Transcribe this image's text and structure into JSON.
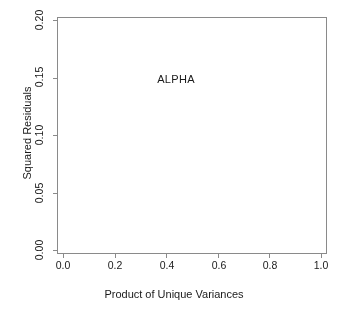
{
  "chart_data": {
    "type": "scatter",
    "title": "",
    "xlabel": "Product of Unique Variances",
    "ylabel": "Squared Residuals",
    "xlim": [
      0.0,
      1.0
    ],
    "ylim": [
      0.0,
      0.2
    ],
    "xticks": [
      "0.0",
      "0.2",
      "0.4",
      "0.6",
      "0.8",
      "1.0"
    ],
    "xtick_values": [
      0.0,
      0.2,
      0.4,
      0.6,
      0.8,
      1.0
    ],
    "yticks": [
      "0.00",
      "0.05",
      "0.10",
      "0.15",
      "0.20"
    ],
    "ytick_values": [
      0.0,
      0.05,
      0.1,
      0.15,
      0.2
    ],
    "grid": false,
    "legend": "none",
    "marker": "open-circle",
    "marker_color": "#000000",
    "marker_size_px": 3.1,
    "annotations": [
      {
        "text": "ALPHA",
        "x": 0.44,
        "y": 0.147
      }
    ],
    "point_count_approx": 3000,
    "outliers": [
      {
        "x": 0.131,
        "y": 0.108
      },
      {
        "x": 0.128,
        "y": 0.085
      },
      {
        "x": 0.126,
        "y": 0.076
      },
      {
        "x": 0.04,
        "y": 0.067
      },
      {
        "x": 0.085,
        "y": 0.057
      },
      {
        "x": 0.228,
        "y": 0.055
      },
      {
        "x": 0.402,
        "y": 0.06
      },
      {
        "x": 0.423,
        "y": 0.06
      },
      {
        "x": 0.196,
        "y": 0.05
      },
      {
        "x": 0.188,
        "y": 0.047
      },
      {
        "x": 0.062,
        "y": 0.043
      },
      {
        "x": 0.52,
        "y": 0.042
      },
      {
        "x": 0.632,
        "y": 0.038
      },
      {
        "x": 0.712,
        "y": 0.038
      },
      {
        "x": 0.082,
        "y": 0.036
      },
      {
        "x": 0.205,
        "y": 0.035
      },
      {
        "x": 0.33,
        "y": 0.035
      },
      {
        "x": 0.617,
        "y": 0.031
      },
      {
        "x": 0.815,
        "y": 0.017
      }
    ],
    "envelope": [
      {
        "x": 0.0,
        "y": 0.022
      },
      {
        "x": 0.05,
        "y": 0.026
      },
      {
        "x": 0.1,
        "y": 0.028
      },
      {
        "x": 0.2,
        "y": 0.028
      },
      {
        "x": 0.3,
        "y": 0.026
      },
      {
        "x": 0.4,
        "y": 0.025
      },
      {
        "x": 0.5,
        "y": 0.023
      },
      {
        "x": 0.6,
        "y": 0.02
      },
      {
        "x": 0.7,
        "y": 0.016
      },
      {
        "x": 0.8,
        "y": 0.012
      },
      {
        "x": 0.86,
        "y": 0.008
      },
      {
        "x": 0.91,
        "y": 0.003
      }
    ],
    "x_data_min": 0.003,
    "x_data_max": 0.912
  }
}
